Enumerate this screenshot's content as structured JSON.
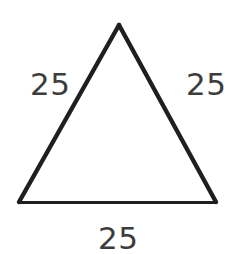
{
  "figure": {
    "kind": "equilateral-triangle-diagram",
    "background_color": "#ffffff",
    "stroke_color": "#1f1f1f",
    "stroke_width_sides": 4,
    "stroke_width_base": 3,
    "label_color": "#3c3c3c",
    "vertices": {
      "apex": [
        119,
        25
      ],
      "bottom_left": [
        19,
        202
      ],
      "bottom_right": [
        216,
        202
      ]
    },
    "labels": {
      "left_side": "25",
      "right_side": "25",
      "base": "25"
    }
  }
}
